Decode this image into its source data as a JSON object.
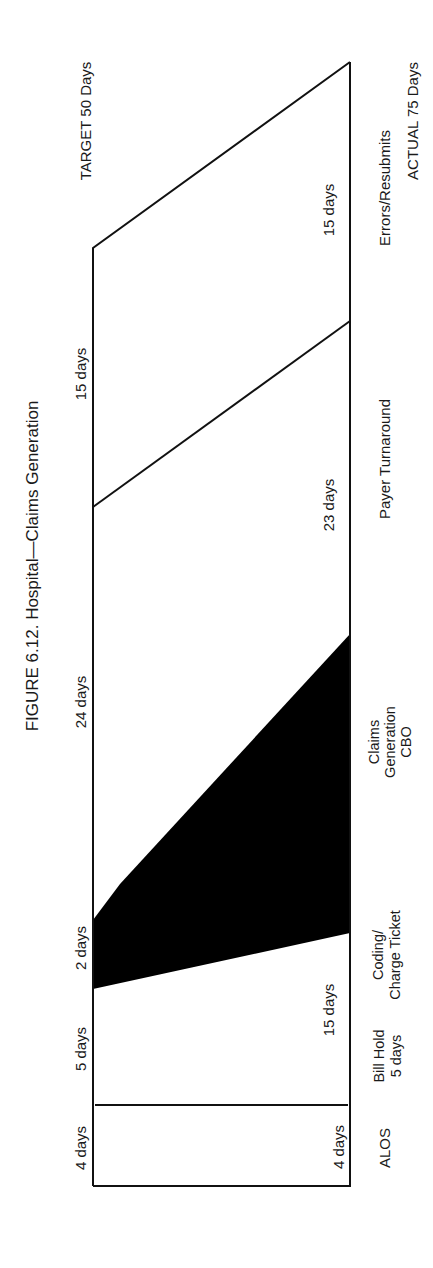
{
  "figure": {
    "title": "FIGURE 6.12. Hospital—Claims Generation",
    "target_label": "TARGET 50 Days",
    "actual_label": "ACTUAL 75 Days"
  },
  "target_segments": [
    {
      "label": "4 days"
    },
    {
      "label": "5 days"
    },
    {
      "label": "2 days"
    },
    {
      "label": "24 days"
    },
    {
      "label": "15 days"
    }
  ],
  "actual_segments": [
    {
      "label": "4 days"
    },
    {
      "label": "15 days"
    },
    {
      "label": "23 days"
    },
    {
      "label": "15 days"
    }
  ],
  "categories": [
    {
      "line1": "ALOS"
    },
    {
      "line1": "Bill Hold",
      "line2": "5 days"
    },
    {
      "line1": "Coding/",
      "line2": "Charge Ticket"
    },
    {
      "line1": "Claims",
      "line2": "Generation",
      "line3": "CBO"
    },
    {
      "line1": "Payer Turnaround"
    },
    {
      "line1": "Errors/Resubmits"
    }
  ],
  "colors": {
    "highlight": "#000000",
    "line": "#111111",
    "background": "#ffffff"
  }
}
